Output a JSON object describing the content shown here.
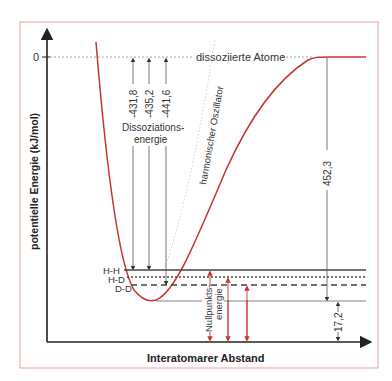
{
  "diagram": {
    "y_axis_label": "potentielle Energie (kJ/mol)",
    "x_axis_label": "Interatomarer Abstand",
    "zero_tick": "0",
    "dissociated_label": "dissoziierte Atome",
    "harmonic_label": "harmonischer Oszillator",
    "dissociation_label_line1": "Dissoziations-",
    "dissociation_label_line2": "energie",
    "zero_point_label_line1": "Nullpunkts-",
    "zero_point_label_line2": "energie",
    "levels": [
      {
        "name": "H-H",
        "style": "solid"
      },
      {
        "name": "H-D",
        "style": "dotted"
      },
      {
        "name": "D-D",
        "style": "dashed"
      }
    ],
    "dissociation_energies": [
      "-431,8",
      "-435,2",
      "-441,6"
    ],
    "well_depth": "452,3",
    "zero_point_hh": "17,2",
    "colors": {
      "curve": "#c8342f",
      "frame": "#e8a0a0",
      "axis": "#222222",
      "arrows_red": "#c8342f",
      "lines": "#555555"
    }
  }
}
